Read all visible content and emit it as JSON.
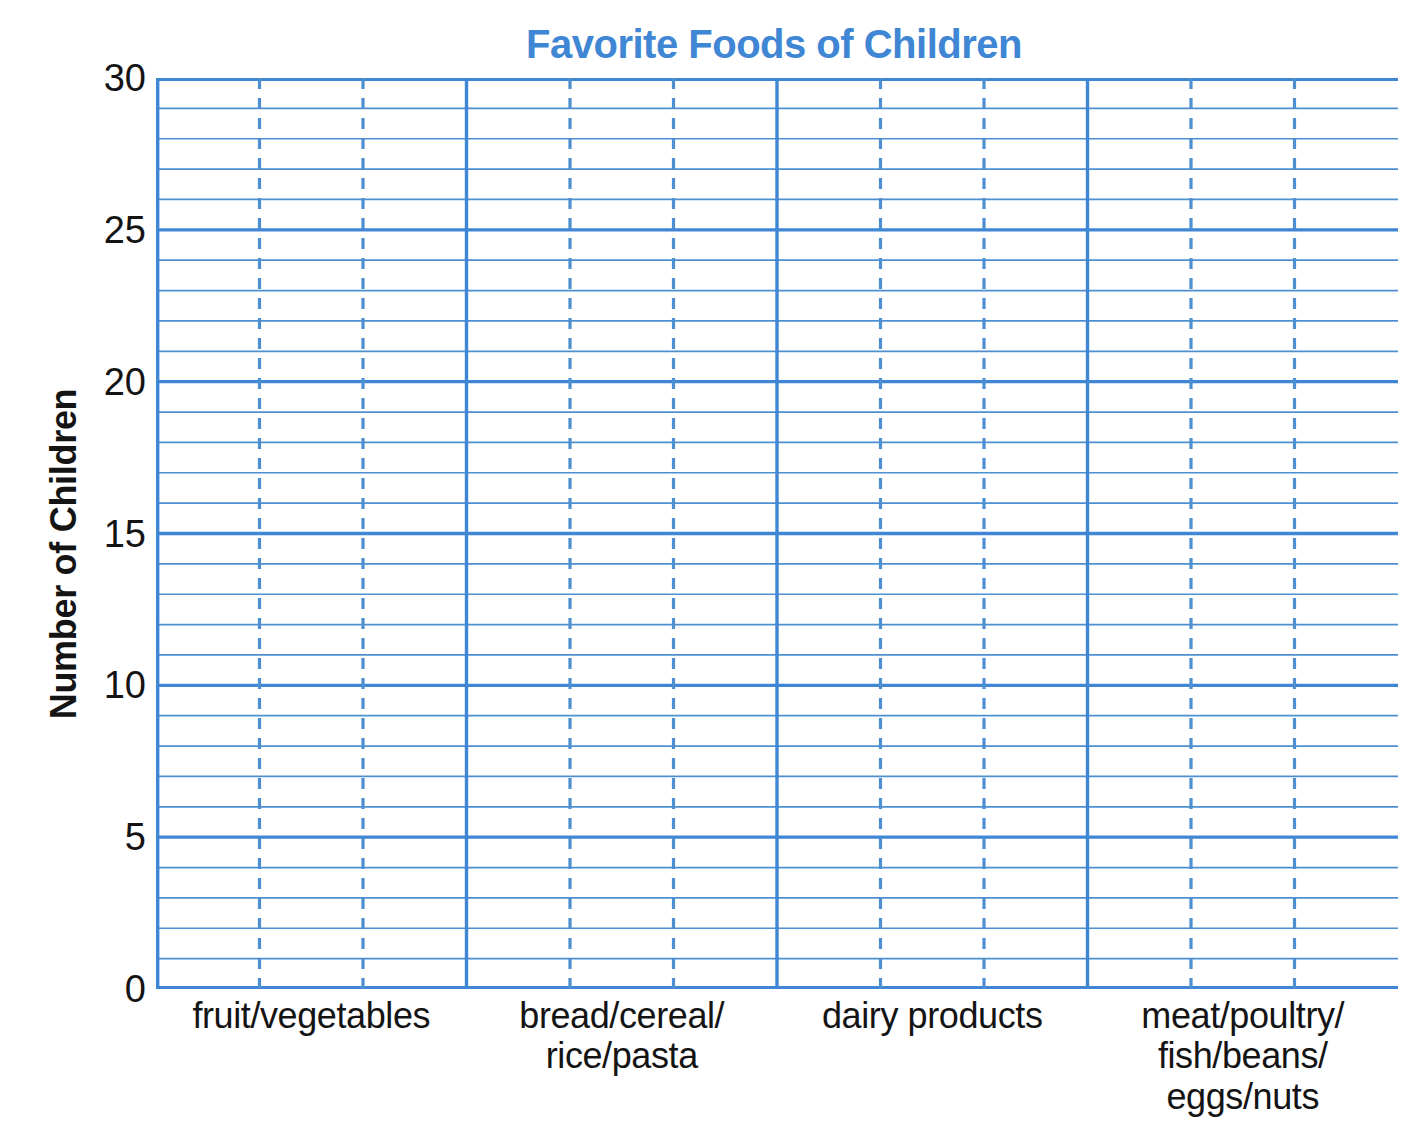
{
  "page": {
    "top_cut_text": "        "
  },
  "chart_data": {
    "type": "bar",
    "title": "Favorite Foods of Children",
    "xlabel": "",
    "ylabel": "Number of Children",
    "categories": [
      "fruit/vegetables",
      "bread/cereal/\nrice/pasta",
      "dairy products",
      "meat/poultry/\nfish/beans/\neggs/nuts"
    ],
    "values": [
      null,
      null,
      null,
      null
    ],
    "ylim": [
      0,
      30
    ],
    "ytick_labels": [
      "0",
      "5",
      "10",
      "15",
      "20",
      "25",
      "30"
    ],
    "ytick_values": [
      0,
      5,
      10,
      15,
      20,
      25,
      30
    ],
    "y_minor_step": 1,
    "y_major_step": 5,
    "grid": true,
    "grid_style": "blank grid worksheet - no bars drawn",
    "legend": null,
    "bars_per_category": 3,
    "colors": {
      "grid_blue": "#4d8fd0",
      "grid_blue_major": "#3f86d4",
      "title_blue": "#3f86d4",
      "text_black": "#141414",
      "background": "#ffffff"
    }
  }
}
